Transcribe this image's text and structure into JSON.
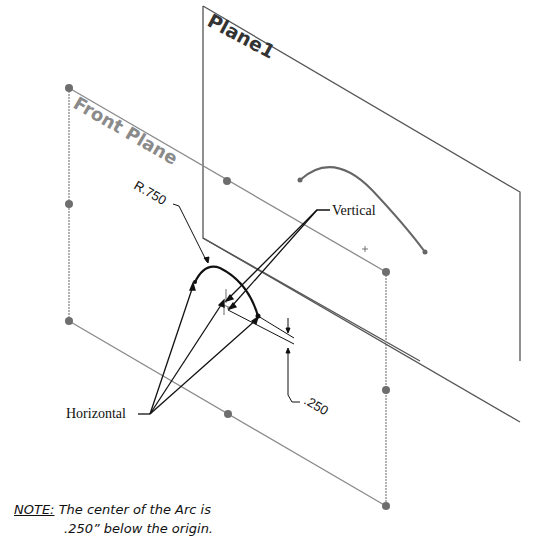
{
  "diagram": {
    "planes": [
      {
        "name": "Front Plane",
        "label": "Front Plane",
        "color": "#888888"
      },
      {
        "name": "Plane1",
        "label": "Plane1",
        "color": "#555555"
      }
    ],
    "annotations": {
      "radius": "R.750",
      "vertical": "Vertical",
      "horizontal": "Horizontal",
      "offset": ".250"
    },
    "note": {
      "keyword": "NOTE:",
      "line1": "The center of the Arc is",
      "line2": ".250” below the origin."
    },
    "colors": {
      "plane_outline": "#8a8a8a",
      "plane1_outline": "#555555",
      "sketch": "#111111",
      "handle": "#6e6e6e"
    }
  }
}
